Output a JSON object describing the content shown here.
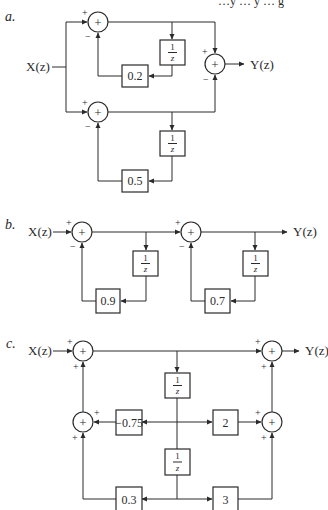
{
  "header_fragment": "…y … y … g",
  "diagrams": {
    "a": {
      "label": "a.",
      "input": "X(z)",
      "output": "Y(z)",
      "top_branch": {
        "summer": {
          "symbol": "+",
          "signs": [
            "+",
            "−"
          ]
        },
        "delay": {
          "num": "1",
          "den": "z"
        },
        "gain": "0.2"
      },
      "bottom_branch": {
        "summer": {
          "symbol": "+",
          "signs": [
            "+",
            "−"
          ]
        },
        "delay": {
          "num": "1",
          "den": "z"
        },
        "gain": "0.5"
      },
      "output_summer": {
        "symbol": "+",
        "signs": [
          "+",
          "−"
        ]
      }
    },
    "b": {
      "label": "b.",
      "input": "X(z)",
      "output": "Y(z)",
      "stage1": {
        "summer": {
          "symbol": "+",
          "signs": [
            "+",
            "−"
          ]
        },
        "delay": {
          "num": "1",
          "den": "z"
        },
        "gain": "0.9"
      },
      "stage2": {
        "summer": {
          "symbol": "+",
          "signs": [
            "+",
            "−"
          ]
        },
        "delay": {
          "num": "1",
          "den": "z"
        },
        "gain": "0.7"
      }
    },
    "c": {
      "label": "c.",
      "input": "X(z)",
      "output": "Y(z)",
      "input_summer": {
        "symbol": "+",
        "signs": [
          "+",
          "+"
        ]
      },
      "output_summer": {
        "symbol": "+",
        "signs": [
          "+",
          "+"
        ]
      },
      "left_mid_summer": {
        "symbol": "+",
        "signs": [
          "+",
          "+"
        ]
      },
      "right_mid_summer": {
        "symbol": "+",
        "signs": [
          "+",
          "+"
        ]
      },
      "delay1": {
        "num": "1",
        "den": "z"
      },
      "delay2": {
        "num": "1",
        "den": "z"
      },
      "gains": {
        "a1": "−0.75",
        "b1": "2",
        "a2": "0.3",
        "b2": "3"
      }
    }
  }
}
